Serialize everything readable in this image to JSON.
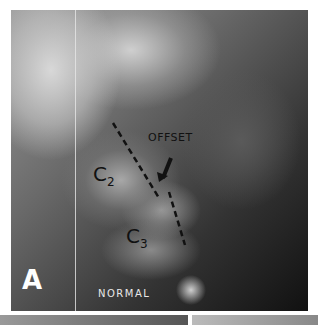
{
  "figure": {
    "panel_label": "A",
    "caption": "NORMAL",
    "annotations": {
      "vertebra_upper": {
        "base": "C",
        "sub": "2"
      },
      "vertebra_lower": {
        "base": "C",
        "sub": "3"
      },
      "arrow_label": "OFFSET"
    }
  }
}
